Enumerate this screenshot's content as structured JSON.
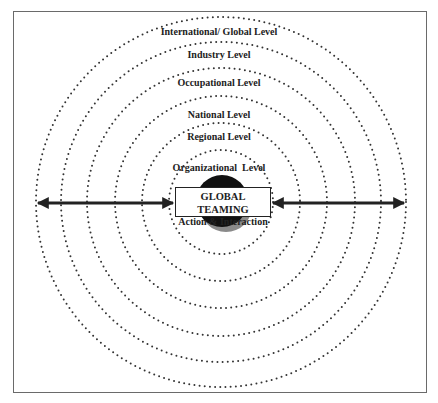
{
  "diagram": {
    "center": {
      "title": "GLOBAL TEAMING",
      "subtitle": "Action & Interaction"
    },
    "levels": [
      {
        "label": "International/ Global Level",
        "radius": 185
      },
      {
        "label": "Industry Level",
        "radius": 160
      },
      {
        "label": "Occupational Level",
        "radius": 134
      },
      {
        "label": "National Level",
        "radius": 106
      },
      {
        "label": "Regional Level",
        "radius": 79
      },
      {
        "label": "Organizational  Level",
        "radius": 52
      }
    ],
    "arrows": {
      "left": "bidirectional arrow from center box to outer edge (left)",
      "right": "bidirectional arrow from center box to outer edge (right)"
    },
    "colors": {
      "ink": "#222222",
      "dots": "#333333",
      "shadow": "#8a8a8a",
      "frame": "#6a6a6a"
    }
  }
}
